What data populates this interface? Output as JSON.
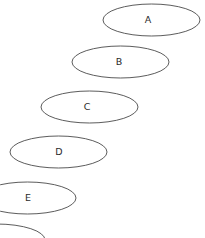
{
  "canvas": {
    "width": 205,
    "height": 238,
    "background_color": "#ffffff"
  },
  "style": {
    "stroke_color": "#4a4a4a",
    "stroke_width": 0.9,
    "fill": "none",
    "label_color": "#2b2b2b",
    "label_font_size": 9.5
  },
  "diagram": {
    "type": "cascading-ellipses",
    "ellipse_count": 6,
    "ellipse_width": 97,
    "ellipse_height": 32,
    "step_x": -31,
    "step_y": 45
  },
  "ellipses": [
    {
      "id": "a",
      "label": "A",
      "cx": 151.5,
      "cy": 20,
      "rx": 48.5,
      "ry": 16,
      "label_x": 148,
      "label_y": 20,
      "clipped": false,
      "label_visible": true
    },
    {
      "id": "b",
      "label": "B",
      "cx": 120.5,
      "cy": 62,
      "rx": 48.5,
      "ry": 16,
      "label_x": 119,
      "label_y": 62,
      "clipped": false,
      "label_visible": true
    },
    {
      "id": "c",
      "label": "C",
      "cx": 89.5,
      "cy": 107,
      "rx": 48.5,
      "ry": 16,
      "label_x": 87,
      "label_y": 107,
      "clipped": false,
      "label_visible": true
    },
    {
      "id": "d",
      "label": "D",
      "cx": 58.5,
      "cy": 152,
      "rx": 48.5,
      "ry": 16,
      "label_x": 59,
      "label_y": 152,
      "clipped": false,
      "label_visible": true
    },
    {
      "id": "e",
      "label": "E",
      "cx": 27.5,
      "cy": 198,
      "rx": 48.5,
      "ry": 16,
      "label_x": 28,
      "label_y": 198,
      "clipped": true,
      "label_visible": true
    },
    {
      "id": "f",
      "label": "",
      "cx": -3.5,
      "cy": 240,
      "rx": 48.5,
      "ry": 16,
      "label_x": -3.5,
      "label_y": 240,
      "clipped": true,
      "label_visible": false
    }
  ]
}
